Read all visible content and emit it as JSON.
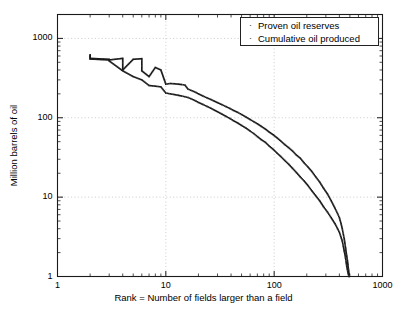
{
  "chart_data": {
    "type": "scatter",
    "title": "",
    "xlabel": "Rank = Number of fields larger than a field",
    "ylabel": "Million barrels of oil",
    "xscale": "log",
    "yscale": "log",
    "xlim": [
      1,
      1000
    ],
    "ylim": [
      1,
      2000
    ],
    "xticks": [
      "1",
      "10",
      "100",
      "1000"
    ],
    "xtick_values": [
      1,
      10,
      100,
      1000
    ],
    "yticks": [
      "1",
      "10",
      "100",
      "1000"
    ],
    "ytick_values": [
      1,
      10,
      100,
      1000
    ],
    "grid": true,
    "legend_position": "top-right",
    "marker": "dot",
    "series": [
      {
        "name": "Proven oil reserves",
        "color": "#1a1a1a",
        "x": [
          2,
          2,
          3,
          3,
          4,
          4,
          5,
          6,
          6,
          7,
          8,
          9,
          10,
          11,
          12,
          13,
          14,
          15,
          16,
          17,
          18,
          19,
          20,
          22,
          24,
          26,
          28,
          30,
          33,
          36,
          39,
          42,
          46,
          50,
          55,
          60,
          65,
          70,
          76,
          83,
          90,
          98,
          106,
          115,
          125,
          136,
          148,
          160,
          174,
          189,
          205,
          223,
          242,
          263,
          285,
          310,
          336,
          365,
          385,
          400,
          415,
          425,
          435,
          443,
          450,
          456,
          462,
          468,
          474,
          480,
          486,
          492
        ],
        "y": [
          620,
          560,
          545,
          535,
          560,
          400,
          545,
          555,
          390,
          330,
          430,
          400,
          265,
          270,
          268,
          265,
          262,
          258,
          230,
          222,
          215,
          208,
          200,
          188,
          178,
          170,
          162,
          155,
          146,
          138,
          131,
          124,
          117,
          110,
          102,
          95,
          89,
          84,
          78,
          72,
          66,
          61,
          56,
          51,
          46,
          42,
          38,
          34,
          31,
          27,
          24,
          21,
          18,
          15.5,
          13,
          11,
          9,
          7.2,
          6.2,
          5.5,
          4.6,
          4.0,
          3.4,
          3.0,
          2.6,
          2.3,
          2.0,
          1.8,
          1.6,
          1.4,
          1.2,
          1.05
        ]
      },
      {
        "name": "Cumulative oil produced",
        "color": "#1a1a1a",
        "x": [
          2,
          2,
          3,
          3,
          4,
          5,
          6,
          7,
          8,
          9,
          10,
          11,
          12,
          13,
          14,
          15,
          16,
          17,
          18,
          19,
          20,
          22,
          24,
          26,
          28,
          30,
          33,
          36,
          39,
          42,
          46,
          50,
          55,
          60,
          65,
          70,
          76,
          83,
          90,
          98,
          106,
          115,
          125,
          136,
          148,
          160,
          174,
          189,
          205,
          223,
          242,
          263,
          285,
          310,
          336,
          365,
          385,
          400,
          415,
          425,
          435,
          443,
          450,
          456,
          462,
          468,
          474,
          480,
          486,
          492
        ],
        "y": [
          600,
          550,
          535,
          520,
          390,
          330,
          300,
          255,
          250,
          245,
          205,
          200,
          196,
          192,
          188,
          184,
          180,
          174,
          168,
          162,
          156,
          147,
          139,
          132,
          125,
          119,
          111,
          104,
          98,
          92,
          86,
          80,
          74,
          68,
          63,
          58,
          53,
          49,
          44,
          40,
          36,
          32.5,
          29,
          26,
          23,
          20.5,
          18,
          16,
          14,
          12,
          10.4,
          9,
          7.6,
          6.5,
          5.5,
          4.6,
          4.0,
          3.6,
          3.1,
          2.8,
          2.4,
          2.1,
          1.9,
          1.7,
          1.5,
          1.35,
          1.22,
          1.12,
          1.05,
          1.0
        ]
      }
    ]
  },
  "legend": {
    "marker_glyph": "·",
    "items": [
      {
        "label": "Proven oil reserves"
      },
      {
        "label": "Cumulative oil produced"
      }
    ]
  }
}
